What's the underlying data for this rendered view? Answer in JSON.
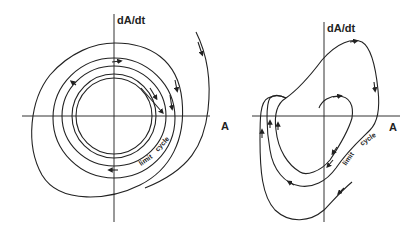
{
  "diagram": {
    "type": "phase-plane limit cycle diagrams",
    "panels": [
      {
        "id": "left",
        "y_axis_label": "dA/dt",
        "x_axis_label": "A",
        "curve_label": [
          "limit",
          "cycle"
        ],
        "description": "Nested near-circular trajectories spiraling onto a stable limit cycle from inside and outside"
      },
      {
        "id": "right",
        "y_axis_label": "dA/dt",
        "x_axis_label": "A",
        "curve_label": [
          "limit",
          "cycle"
        ],
        "description": "Relaxation-type limit cycle; trajectories from inside and outside converge onto it"
      }
    ]
  }
}
